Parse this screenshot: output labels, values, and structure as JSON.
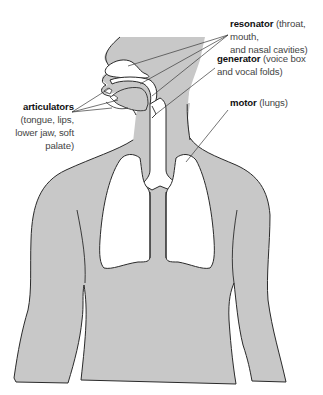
{
  "diagram": {
    "type": "anatomical diagram",
    "colors": {
      "body_fill": "#c8c8c8",
      "outline": "#2a2a2a",
      "cavity_fill": "#ffffff",
      "label_term": "#111111",
      "label_desc": "#444444"
    }
  },
  "labels": {
    "resonator": {
      "term": "resonator",
      "desc_line1": "(throat, mouth,",
      "desc_line2": "and nasal cavities)"
    },
    "generator": {
      "term": "generator",
      "desc_line1": "(voice box",
      "desc_line2": "and vocal folds)"
    },
    "motor": {
      "term": "motor",
      "desc": "(lungs)"
    },
    "articulators": {
      "term": "articulators",
      "desc_line1": "(tongue, lips,",
      "desc_line2": "lower jaw, soft",
      "desc_line3": "palate)"
    }
  }
}
